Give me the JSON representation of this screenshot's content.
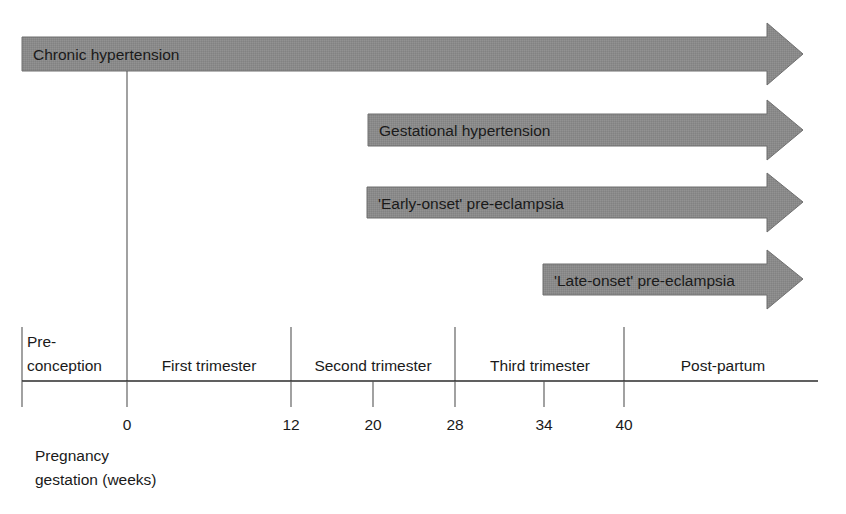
{
  "figure": {
    "background_color": "#ffffff",
    "arrow_fill_color": "#8a8a8a",
    "arrow_stroke_color": "#6f6f6f",
    "text_color": "#1a1a1a",
    "axis_color": "#2b2b2b"
  },
  "bars": [
    {
      "label": "Chronic hypertension",
      "start_week": -6,
      "end_week": 48,
      "x_start": 22,
      "x_tip": 803,
      "y_top": 37,
      "y_bottom": 71,
      "text_x": 33,
      "text_y": 60
    },
    {
      "label": "Gestational hypertension",
      "start_week": 20,
      "end_week": 48,
      "x_start": 368,
      "x_tip": 803,
      "y_top": 114,
      "y_bottom": 146,
      "text_x": 379,
      "text_y": 136
    },
    {
      "label": "'Early-onset' pre-eclampsia",
      "start_week": 20,
      "end_week": 48,
      "x_start": 367,
      "x_tip": 803,
      "y_top": 187,
      "y_bottom": 218,
      "text_x": 378,
      "text_y": 209
    },
    {
      "label": "'Late-onset' pre-eclampsia",
      "start_week": 34,
      "end_week": 48,
      "x_start": 543,
      "x_tip": 803,
      "y_top": 264,
      "y_bottom": 295,
      "text_x": 554,
      "text_y": 286
    }
  ],
  "bands": [
    {
      "label_line1": "Pre-",
      "label_line2": "conception",
      "x_center": 74,
      "x_left": 27
    },
    {
      "label_line1": "First trimester",
      "label_line2": "",
      "x_center": 209,
      "x_left": 0
    },
    {
      "label_line1": "Second trimester",
      "label_line2": "",
      "x_center": 373,
      "x_left": 0
    },
    {
      "label_line1": "Third trimester",
      "label_line2": "",
      "x_center": 540,
      "x_left": 0
    },
    {
      "label_line1": "Post-partum",
      "label_line2": "",
      "x_center": 723,
      "x_left": 0
    }
  ],
  "ticks": [
    {
      "label": "0",
      "x": 127
    },
    {
      "label": "12",
      "x": 291
    },
    {
      "label": "20",
      "x": 373
    },
    {
      "label": "28",
      "x": 455
    },
    {
      "label": "34",
      "x": 544
    },
    {
      "label": "40",
      "x": 624
    }
  ],
  "dividers": [
    {
      "x": 127,
      "y_top": 71,
      "y_bottom": 381
    },
    {
      "x": 22,
      "y_top": 327,
      "y_bottom": 381
    },
    {
      "x": 291,
      "y_top": 327,
      "y_bottom": 381
    },
    {
      "x": 455,
      "y_top": 327,
      "y_bottom": 381
    },
    {
      "x": 624,
      "y_top": 327,
      "y_bottom": 381
    }
  ],
  "axis": {
    "x_start": 22,
    "x_end": 818,
    "y": 381,
    "tick_length": 26
  },
  "caption": {
    "line1": "Pregnancy",
    "line2": "gestation (weeks)",
    "x": 35,
    "y1": 461,
    "y2": 485
  }
}
